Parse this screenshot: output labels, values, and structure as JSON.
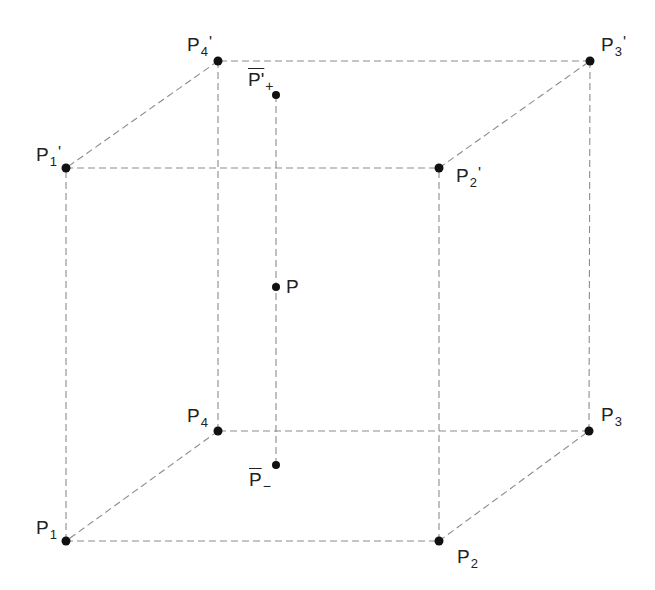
{
  "diagram": {
    "title": "",
    "colors": {
      "edge": "#8c8c8c",
      "vertex": "#111111",
      "label": "#222222",
      "background": "#ffffff"
    },
    "vertices": [
      {
        "id": "P1",
        "x": 66,
        "y": 541,
        "base": "P",
        "sub": "1",
        "prime": ""
      },
      {
        "id": "P2",
        "x": 439,
        "y": 541,
        "base": "P",
        "sub": "2",
        "prime": ""
      },
      {
        "id": "P3",
        "x": 589,
        "y": 431,
        "base": "P",
        "sub": "3",
        "prime": ""
      },
      {
        "id": "P4",
        "x": 218,
        "y": 431,
        "base": "P",
        "sub": "4",
        "prime": ""
      },
      {
        "id": "P1p",
        "x": 66,
        "y": 168,
        "base": "P",
        "sub": "1",
        "prime": "'"
      },
      {
        "id": "P2p",
        "x": 439,
        "y": 168,
        "base": "P",
        "sub": "2",
        "prime": "'"
      },
      {
        "id": "P3p",
        "x": 590,
        "y": 61,
        "base": "P",
        "sub": "3",
        "prime": "'"
      },
      {
        "id": "P4p",
        "x": 218,
        "y": 61,
        "base": "P",
        "sub": "4",
        "prime": "'"
      },
      {
        "id": "P",
        "x": 276,
        "y": 287,
        "base": "P",
        "sub": "",
        "prime": ""
      },
      {
        "id": "Pplus",
        "x": 276,
        "y": 95,
        "base": "P'",
        "sub": "+",
        "prime": ""
      },
      {
        "id": "Pminus",
        "x": 276,
        "y": 465,
        "base": "P",
        "sub": "−",
        "prime": ""
      }
    ],
    "labels": {
      "P1": {
        "base": "P",
        "sub": "1"
      },
      "P2": {
        "base": "P",
        "sub": "2"
      },
      "P3": {
        "base": "P",
        "sub": "3"
      },
      "P4": {
        "base": "P",
        "sub": "4"
      },
      "P1p": {
        "base": "P",
        "sub": "1",
        "prime": "'"
      },
      "P2p": {
        "base": "P",
        "sub": "2",
        "prime": "'"
      },
      "P3p": {
        "base": "P",
        "sub": "3",
        "prime": "'"
      },
      "P4p": {
        "base": "P",
        "sub": "4",
        "prime": "'"
      },
      "P": {
        "base": "P"
      },
      "Pplus": {
        "base": "P'",
        "sub": "+"
      },
      "Pminus": {
        "base": "P",
        "sub": "−"
      }
    },
    "edges": [
      [
        "P1",
        "P2"
      ],
      [
        "P2",
        "P3"
      ],
      [
        "P3",
        "P4"
      ],
      [
        "P4",
        "P1"
      ],
      [
        "P1p",
        "P2p"
      ],
      [
        "P2p",
        "P3p"
      ],
      [
        "P3p",
        "P4p"
      ],
      [
        "P4p",
        "P1p"
      ],
      [
        "P1",
        "P1p"
      ],
      [
        "P2",
        "P2p"
      ],
      [
        "P3",
        "P3p"
      ],
      [
        "P4",
        "P4p"
      ],
      [
        "Pplus",
        "Pminus"
      ]
    ]
  }
}
